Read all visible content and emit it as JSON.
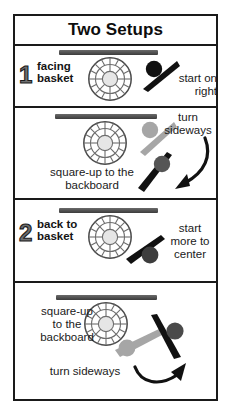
{
  "poster": {
    "title": "Two Setups"
  },
  "panels": [
    {
      "id": "panel-1",
      "step_number": "1",
      "step_label": "facing\nbasket",
      "note": "start on\nright",
      "icons": {
        "backboard": "backboard-bar",
        "ball": "basketball-net-icon",
        "player": "player-figure-dark"
      }
    },
    {
      "id": "panel-2",
      "step_number": "",
      "step_label": "square-up to the\nbackboard",
      "note": "turn\nsideways",
      "icons": {
        "backboard": "backboard-bar",
        "ball": "basketball-net-icon",
        "player_before": "player-figure-gray",
        "player_after": "player-figure-dark",
        "arrow": "curved-arrow-down-left-icon"
      }
    },
    {
      "id": "panel-3",
      "step_number": "2",
      "step_label": "back to\nbasket",
      "note": "start\nmore to\ncenter",
      "icons": {
        "backboard": "backboard-bar",
        "ball": "basketball-net-icon",
        "player": "player-figure-dark"
      }
    },
    {
      "id": "panel-4",
      "step_number": "",
      "step_label": "square-up\nto the\nbackboard",
      "note": "turn sideways",
      "icons": {
        "backboard": "backboard-bar",
        "ball": "basketball-net-icon",
        "player_before": "player-figure-gray",
        "player_after": "player-figure-dark",
        "arrow": "curved-arrow-up-right-icon"
      }
    }
  ],
  "colors": {
    "frame": "#1a1a1a",
    "backboard": "#4a4a4a",
    "figure_dark": "#111111",
    "figure_gray": "#a6a6a6",
    "ball_stroke": "#555555",
    "ball_fill": "#ffffff",
    "text": "#141414"
  }
}
